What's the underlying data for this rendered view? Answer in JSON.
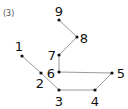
{
  "figure": {
    "label": "(3)",
    "label_pos": [
      3,
      9
    ],
    "line_color": "#9a9a9a",
    "dot_color": "#111111",
    "text_color": "#111111",
    "points": [
      {
        "n": "1",
        "x": 22,
        "y": 56,
        "lx": 19,
        "ly": 51,
        "anchor": "middle"
      },
      {
        "n": "2",
        "x": 41,
        "y": 73,
        "lx": 40,
        "ly": 88,
        "anchor": "middle"
      },
      {
        "n": "3",
        "x": 59,
        "y": 90,
        "lx": 59,
        "ly": 106,
        "anchor": "middle"
      },
      {
        "n": "4",
        "x": 95,
        "y": 90,
        "lx": 95,
        "ly": 106,
        "anchor": "middle"
      },
      {
        "n": "5",
        "x": 112,
        "y": 73,
        "lx": 121,
        "ly": 78,
        "anchor": "middle"
      },
      {
        "n": "6",
        "x": 59,
        "y": 72,
        "lx": 51,
        "ly": 78,
        "anchor": "middle"
      },
      {
        "n": "7",
        "x": 59,
        "y": 55,
        "lx": 52,
        "ly": 60,
        "anchor": "middle"
      },
      {
        "n": "8",
        "x": 77,
        "y": 37,
        "lx": 84,
        "ly": 43,
        "anchor": "middle"
      },
      {
        "n": "9",
        "x": 59,
        "y": 20,
        "lx": 59,
        "ly": 16,
        "anchor": "middle"
      }
    ],
    "path_order": [
      "1",
      "2",
      "3",
      "4",
      "5",
      "6",
      "7",
      "8",
      "9"
    ]
  }
}
